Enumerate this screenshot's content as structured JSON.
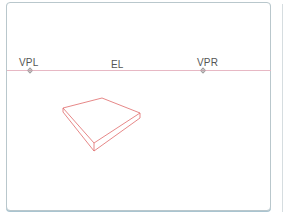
{
  "diagram": {
    "horizon_label": "EL",
    "vanishing_points": [
      {
        "label": "VPL",
        "x": 30,
        "y": 70
      },
      {
        "label": "VPR",
        "x": 203,
        "y": 70
      }
    ],
    "colors": {
      "horizon_line": "#e7b8c4",
      "shape_stroke": "#e06a6a",
      "frame_border": "#b9c7cc",
      "text": "#555555"
    }
  }
}
